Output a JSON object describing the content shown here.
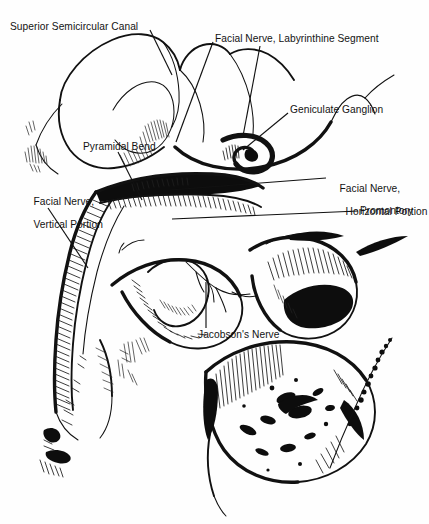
{
  "figure": {
    "kind": "anatomical-line-drawing",
    "background_color": "#fefefe",
    "ink_color": "#111111",
    "width_px": 429,
    "height_px": 524
  },
  "labels": {
    "superior_semicircular_canal": "Superior Semicircular Canal",
    "facial_nerve_labyrinthine_segment": "Facial Nerve, Labyrinthine Segment",
    "geniculate_ganglion": "Geniculate Ganglion",
    "pyramidal_bend": "Pyramidal Bend",
    "facial_nerve_horizontal_line1": "Facial Nerve,",
    "facial_nerve_horizontal_line2": "Horizontal Portion",
    "facial_nerve_vertical_line1": "Facial Nerve,",
    "facial_nerve_vertical_line2": "Vertical Portion",
    "promontory": "Promontory",
    "jacobsons_nerve": "Jacobson's Nerve"
  }
}
